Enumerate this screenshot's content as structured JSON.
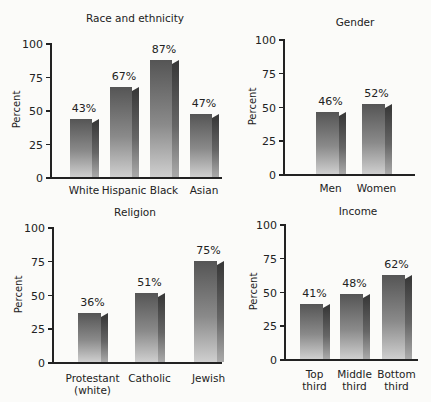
{
  "chart_data": [
    {
      "type": "bar",
      "title": "Race and ethnicity",
      "xlabel": "",
      "ylabel": "Percent",
      "ylim": [
        0,
        100
      ],
      "yticks": [
        0,
        25,
        50,
        75,
        100
      ],
      "categories": [
        "White",
        "Hispanic",
        "Black",
        "Asian"
      ],
      "values": [
        43,
        67,
        87,
        47
      ],
      "value_labels": [
        "43%",
        "67%",
        "87%",
        "47%"
      ],
      "grid": false,
      "legend": null
    },
    {
      "type": "bar",
      "title": "Gender",
      "xlabel": "",
      "ylabel": "Percent",
      "ylim": [
        0,
        100
      ],
      "yticks": [
        0,
        25,
        50,
        75,
        100
      ],
      "categories": [
        "Men",
        "Women"
      ],
      "values": [
        46,
        52
      ],
      "value_labels": [
        "46%",
        "52%"
      ],
      "grid": false,
      "legend": null
    },
    {
      "type": "bar",
      "title": "Religion",
      "xlabel": "",
      "ylabel": "Percent",
      "ylim": [
        0,
        100
      ],
      "yticks": [
        0,
        25,
        50,
        75,
        100
      ],
      "categories": [
        "Protestant (white)",
        "Catholic",
        "Jewish"
      ],
      "values": [
        36,
        51,
        75
      ],
      "value_labels": [
        "36%",
        "51%",
        "75%"
      ],
      "grid": false,
      "legend": null
    },
    {
      "type": "bar",
      "title": "Income",
      "xlabel": "",
      "ylabel": "Percent",
      "ylim": [
        0,
        100
      ],
      "yticks": [
        0,
        25,
        50,
        75,
        100
      ],
      "categories": [
        "Top third",
        "Middle third",
        "Bottom third"
      ],
      "values": [
        41,
        48,
        62
      ],
      "value_labels": [
        "41%",
        "48%",
        "62%"
      ],
      "grid": false,
      "legend": null
    }
  ],
  "panels": [
    {
      "title": "Race and ethnicity",
      "ylabel": "Percent",
      "ticks": [
        "0",
        "25",
        "50",
        "75",
        "100"
      ],
      "bars": [
        {
          "cat": [
            "White"
          ],
          "label": "43%"
        },
        {
          "cat": [
            "Hispanic"
          ],
          "label": "67%"
        },
        {
          "cat": [
            "Black"
          ],
          "label": "87%"
        },
        {
          "cat": [
            "Asian"
          ],
          "label": "47%"
        }
      ]
    },
    {
      "title": "Gender",
      "ylabel": "Percent",
      "ticks": [
        "0",
        "25",
        "50",
        "75",
        "100"
      ],
      "bars": [
        {
          "cat": [
            "Men"
          ],
          "label": "46%"
        },
        {
          "cat": [
            "Women"
          ],
          "label": "52%"
        }
      ]
    },
    {
      "title": "Religion",
      "ylabel": "Percent",
      "ticks": [
        "0",
        "25",
        "50",
        "75",
        "100"
      ],
      "bars": [
        {
          "cat": [
            "Protestant",
            "(white)"
          ],
          "label": "36%"
        },
        {
          "cat": [
            "Catholic"
          ],
          "label": "51%"
        },
        {
          "cat": [
            "Jewish"
          ],
          "label": "75%"
        }
      ]
    },
    {
      "title": "Income",
      "ylabel": "Percent",
      "ticks": [
        "0",
        "25",
        "50",
        "75",
        "100"
      ],
      "bars": [
        {
          "cat": [
            "Top",
            "third"
          ],
          "label": "41%"
        },
        {
          "cat": [
            "Middle",
            "third"
          ],
          "label": "48%"
        },
        {
          "cat": [
            "Bottom",
            "third"
          ],
          "label": "62%"
        }
      ]
    }
  ],
  "colors": {
    "bar_dark": "#555555",
    "bar_light": "#cfcfcf",
    "bar_side": "#3a3a3a",
    "axis": "#222222",
    "background": "#fbfbf9"
  }
}
